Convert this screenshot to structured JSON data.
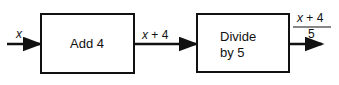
{
  "diagram": {
    "input_label": "x",
    "boxes": [
      {
        "label": "Add 4"
      },
      {
        "label_line1": "Divide",
        "label_line2": "by 5"
      }
    ],
    "intermediate": {
      "var": "x",
      "rest": "+ 4"
    },
    "output": {
      "numerator_var": "x",
      "numerator_rest": "+ 4",
      "denominator": "5"
    }
  }
}
